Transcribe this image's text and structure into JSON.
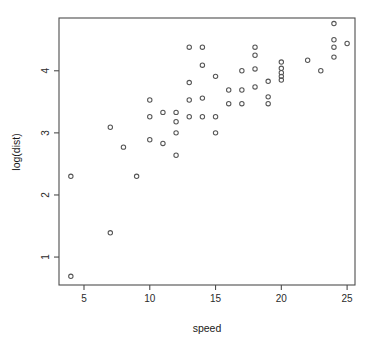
{
  "chart_data": {
    "type": "scatter",
    "title": "",
    "subtitle": "",
    "xlabel": "speed",
    "ylabel": "log(dist)",
    "xlim": [
      3.1,
      25.6
    ],
    "ylim": [
      0.55,
      4.85
    ],
    "grid": false,
    "legend": null,
    "xticks": [
      5,
      10,
      15,
      20,
      25
    ],
    "xtick_labels": [
      "5",
      "10",
      "15",
      "20",
      "25"
    ],
    "yticks": [
      1,
      2,
      3,
      4
    ],
    "ytick_labels": [
      "1",
      "2",
      "3",
      "4"
    ],
    "marker": "open-circle",
    "marker_color": "#555555",
    "box_color": "#4d4d4d",
    "background": "#ffffff",
    "n_points": 50,
    "x": [
      4,
      4,
      7,
      7,
      8,
      9,
      10,
      10,
      10,
      11,
      11,
      12,
      12,
      12,
      12,
      13,
      13,
      13,
      13,
      14,
      14,
      14,
      14,
      15,
      15,
      15,
      16,
      16,
      17,
      17,
      17,
      18,
      18,
      18,
      18,
      19,
      19,
      19,
      20,
      20,
      20,
      20,
      20,
      22,
      23,
      24,
      24,
      24,
      24,
      25
    ],
    "y": [
      0.69,
      2.3,
      1.39,
      3.09,
      2.77,
      2.3,
      2.89,
      3.26,
      3.53,
      2.83,
      3.33,
      2.64,
      3.0,
      3.18,
      3.33,
      3.26,
      3.53,
      3.81,
      4.38,
      3.26,
      3.56,
      4.09,
      4.38,
      3.0,
      3.26,
      3.91,
      3.47,
      3.69,
      3.47,
      3.69,
      4.0,
      3.74,
      4.03,
      4.25,
      4.38,
      3.47,
      3.58,
      3.83,
      3.85,
      3.91,
      3.97,
      4.04,
      4.14,
      4.17,
      4.0,
      4.22,
      4.38,
      4.5,
      4.76,
      4.44
    ],
    "points": [
      {
        "x": 4,
        "y": 0.69
      },
      {
        "x": 4,
        "y": 2.3
      },
      {
        "x": 7,
        "y": 1.39
      },
      {
        "x": 7,
        "y": 3.09
      },
      {
        "x": 8,
        "y": 2.77
      },
      {
        "x": 9,
        "y": 2.3
      },
      {
        "x": 10,
        "y": 2.89
      },
      {
        "x": 10,
        "y": 3.26
      },
      {
        "x": 10,
        "y": 3.53
      },
      {
        "x": 11,
        "y": 2.83
      },
      {
        "x": 11,
        "y": 3.33
      },
      {
        "x": 12,
        "y": 2.64
      },
      {
        "x": 12,
        "y": 3.0
      },
      {
        "x": 12,
        "y": 3.18
      },
      {
        "x": 12,
        "y": 3.33
      },
      {
        "x": 13,
        "y": 3.26
      },
      {
        "x": 13,
        "y": 3.53
      },
      {
        "x": 13,
        "y": 3.81
      },
      {
        "x": 13,
        "y": 4.38
      },
      {
        "x": 14,
        "y": 3.26
      },
      {
        "x": 14,
        "y": 3.56
      },
      {
        "x": 14,
        "y": 4.09
      },
      {
        "x": 14,
        "y": 4.38
      },
      {
        "x": 15,
        "y": 3.0
      },
      {
        "x": 15,
        "y": 3.26
      },
      {
        "x": 15,
        "y": 3.91
      },
      {
        "x": 16,
        "y": 3.47
      },
      {
        "x": 16,
        "y": 3.69
      },
      {
        "x": 17,
        "y": 3.47
      },
      {
        "x": 17,
        "y": 3.69
      },
      {
        "x": 17,
        "y": 4.0
      },
      {
        "x": 18,
        "y": 3.74
      },
      {
        "x": 18,
        "y": 4.03
      },
      {
        "x": 18,
        "y": 4.25
      },
      {
        "x": 18,
        "y": 4.38
      },
      {
        "x": 19,
        "y": 3.47
      },
      {
        "x": 19,
        "y": 3.58
      },
      {
        "x": 19,
        "y": 3.83
      },
      {
        "x": 20,
        "y": 3.85
      },
      {
        "x": 20,
        "y": 3.91
      },
      {
        "x": 20,
        "y": 3.97
      },
      {
        "x": 20,
        "y": 4.04
      },
      {
        "x": 20,
        "y": 4.14
      },
      {
        "x": 22,
        "y": 4.17
      },
      {
        "x": 23,
        "y": 4.0
      },
      {
        "x": 24,
        "y": 4.22
      },
      {
        "x": 24,
        "y": 4.38
      },
      {
        "x": 24,
        "y": 4.5
      },
      {
        "x": 24,
        "y": 4.76
      },
      {
        "x": 25,
        "y": 4.44
      }
    ]
  }
}
